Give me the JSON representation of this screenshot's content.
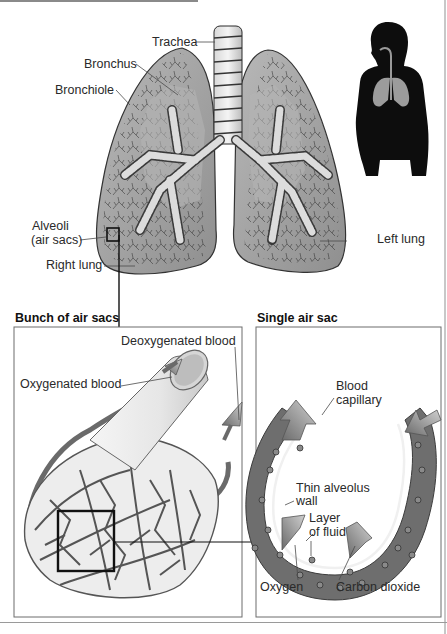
{
  "figure": {
    "main_labels": {
      "trachea": "Trachea",
      "bronchus": "Bronchus",
      "bronchiole": "Bronchiole",
      "alveoli_line1": "Alveoli",
      "alveoli_line2": "(air sacs)",
      "right_lung": "Right lung",
      "left_lung": "Left lung"
    },
    "panels": {
      "bunch": {
        "heading": "Bunch of air sacs",
        "labels": {
          "deoxygenated": "Deoxygenated blood",
          "oxygenated": "Oxygenated blood"
        }
      },
      "single": {
        "heading": "Single air sac",
        "labels": {
          "capillary_line1": "Blood",
          "capillary_line2": "capillary",
          "wall_line1": "Thin alveolus",
          "wall_line2": "wall",
          "fluid_line1": "Layer",
          "fluid_line2": "of fluid",
          "oxygen": "Oxygen",
          "co2": "Carbon dioxide"
        }
      }
    },
    "colors": {
      "lung_fill": "#a9a9a9",
      "lung_dark": "#6e6e6e",
      "capillary": "#707070",
      "silhouette": "#0d0d0d",
      "panel_border": "#6d6d6d"
    }
  }
}
